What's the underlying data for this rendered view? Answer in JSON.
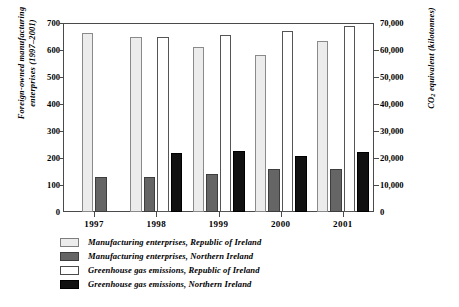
{
  "chart_data": {
    "type": "bar",
    "title": "",
    "subtitle": "",
    "categories": [
      "1997",
      "1998",
      "1999",
      "2000",
      "2001"
    ],
    "xlabel": "",
    "grid": false,
    "legend_position": "bottom-left",
    "axes": {
      "left": {
        "label_line1": "Foreign-owned manufacturing",
        "label_line2": "enterprises (1997–2001)",
        "label": "Foreign-owned manufacturing enterprises (1997–2001)",
        "min": 0,
        "max": 700,
        "step": 100,
        "ticks": [
          "0",
          "100",
          "200",
          "300",
          "400",
          "500",
          "600",
          "700"
        ]
      },
      "right": {
        "label_prefix": "CO",
        "label_sub": "2",
        "label_suffix": " equivalent (kilotonnes)",
        "label": "CO2 equivalent (kilotonnes)",
        "min": 0,
        "max": 70000,
        "step": 10000,
        "ticks": [
          "0",
          "10,000",
          "20,000",
          "30,000",
          "40,000",
          "50,000",
          "60,000",
          "70,000"
        ]
      }
    },
    "series": [
      {
        "name": "Manufacturing enterprises, Republic of Ireland",
        "axis": "left",
        "color": "#ececec",
        "border": "#8a8a8a",
        "values": [
          662,
          648,
          612,
          580,
          632
        ]
      },
      {
        "name": "Manufacturing enterprises, Northern Ireland",
        "axis": "left",
        "color": "#656565",
        "border": "#3d3d3d",
        "values": [
          128,
          130,
          140,
          160,
          158
        ]
      },
      {
        "name": "Greenhouse gas emissions, Republic of Ireland",
        "axis": "right",
        "color": "#ffffff",
        "border": "#555555",
        "values": [
          null,
          64800,
          65600,
          67200,
          69000
        ]
      },
      {
        "name": "Greenhouse gas emissions, Northern Ireland",
        "axis": "right",
        "color": "#111111",
        "border": "#000000",
        "values": [
          null,
          22000,
          22600,
          20800,
          22400
        ]
      }
    ]
  },
  "legend": {
    "items": [
      "Manufacturing enterprises, Republic of Ireland",
      "Manufacturing enterprises, Northern Ireland",
      "Greenhouse gas emissions, Republic of Ireland",
      "Greenhouse gas emissions, Northern Ireland"
    ]
  }
}
